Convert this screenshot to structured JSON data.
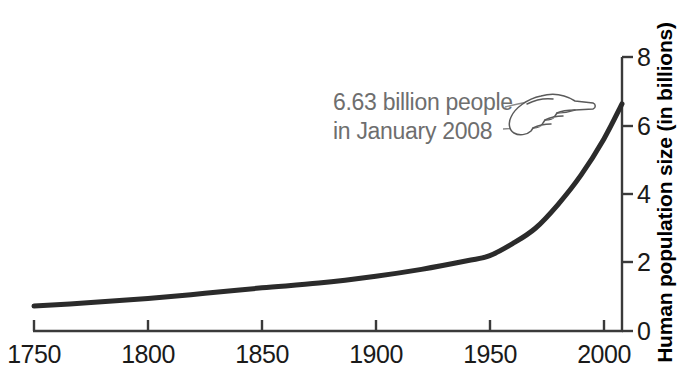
{
  "chart_data": {
    "type": "line",
    "title": "",
    "subtitle": "",
    "xlabel": "",
    "ylabel": "Human population size (in billions)",
    "xlim": [
      1750,
      2008
    ],
    "ylim": [
      0,
      8
    ],
    "grid": false,
    "legend": null,
    "x_ticks": [
      1750,
      1800,
      1850,
      1900,
      1950,
      2000
    ],
    "x_tick_labels": [
      "1750",
      "1800",
      "1850",
      "1900",
      "1950",
      "2000"
    ],
    "y_ticks": [
      0,
      2,
      4,
      6,
      8
    ],
    "y_tick_labels": [
      "0",
      "2",
      "4",
      "6",
      "8"
    ],
    "y_axis_position": "right",
    "series": [
      {
        "name": "Human population",
        "x": [
          1750,
          1775,
          1800,
          1825,
          1850,
          1875,
          1900,
          1920,
          1940,
          1950,
          1960,
          1970,
          1980,
          1990,
          2000,
          2008
        ],
        "values": [
          0.73,
          0.83,
          0.95,
          1.1,
          1.26,
          1.4,
          1.6,
          1.8,
          2.05,
          2.2,
          2.55,
          3.0,
          3.7,
          4.55,
          5.6,
          6.63
        ]
      }
    ],
    "annotations": [
      {
        "text_line_1": "6.63 billion people",
        "text_line_2": "in January 2008",
        "value": 6.63,
        "year": 2008,
        "month": "January",
        "pointer": "pointing-hand-right"
      }
    ],
    "colors": {
      "line": "#2b2b2b",
      "axis": "#3a3a3a",
      "tick_label": "#1a1a1a",
      "annotation_text": "#6e6e6e",
      "axis_title": "#000000",
      "background": "#ffffff"
    }
  },
  "axes": {
    "x_tick_labels": [
      "1750",
      "1800",
      "1850",
      "1900",
      "1950",
      "2000"
    ],
    "y_tick_labels": [
      "0",
      "2",
      "4",
      "6",
      "8"
    ],
    "y_title": "Human population size (in billions)"
  },
  "annotation": {
    "line1": "6.63 billion people",
    "line2": "in January 2008",
    "icon": "pointing-hand-icon"
  }
}
